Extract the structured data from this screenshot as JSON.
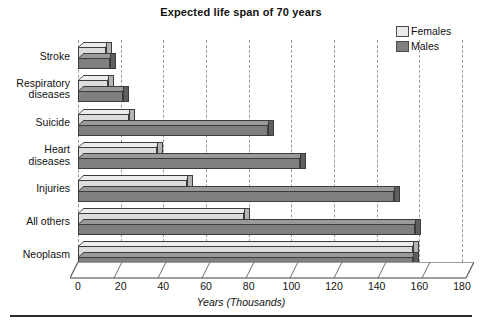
{
  "chart_data": {
    "type": "bar",
    "orientation": "horizontal",
    "title": "Expected life span of 70 years",
    "xlabel": "Years (Thousands)",
    "ylabel": "",
    "xlim": [
      0,
      180
    ],
    "xticks": [
      0,
      20,
      40,
      60,
      80,
      100,
      120,
      140,
      160,
      180
    ],
    "grid": true,
    "grid_axis": "x",
    "grid_style": "dashed",
    "legend_position": "top-right",
    "categories": [
      "Stroke",
      "Respiratory diseases",
      "Suicide",
      "Heart diseases",
      "Injuries",
      "All others",
      "Neoplasm"
    ],
    "series": [
      {
        "name": "Females",
        "color": "#dcdcdc",
        "values": [
          13,
          14,
          24,
          37,
          51,
          78,
          157
        ]
      },
      {
        "name": "Males",
        "color": "#7f7f7f",
        "values": [
          15,
          21,
          89,
          104,
          148,
          158,
          157
        ]
      }
    ]
  },
  "legend": {
    "entries": [
      {
        "label": "Females",
        "swatch_color": "#e4e4e4"
      },
      {
        "label": "Males",
        "swatch_color": "#7f7f7f"
      }
    ]
  },
  "axis": {
    "x_title": "Years (Thousands)",
    "x_tick_labels": [
      "0",
      "20",
      "40",
      "60",
      "80",
      "100",
      "120",
      "140",
      "160",
      "180"
    ]
  },
  "y_categories": [
    {
      "line1": "Stroke",
      "line2": ""
    },
    {
      "line1": "Respiratory",
      "line2": "diseases"
    },
    {
      "line1": "Suicide",
      "line2": ""
    },
    {
      "line1": "Heart",
      "line2": "diseases"
    },
    {
      "line1": "Injuries",
      "line2": ""
    },
    {
      "line1": "All others",
      "line2": ""
    },
    {
      "line1": "Neoplasm",
      "line2": ""
    }
  ]
}
